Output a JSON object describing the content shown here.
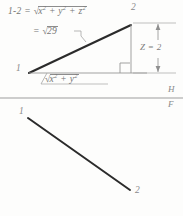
{
  "drawing": {
    "title": "true-length-line-construction",
    "ink_color": "#2b2b2b",
    "pencil_color": "#7d7d7d",
    "background": "#fdfdfc"
  },
  "top_view": {
    "equation_line_1": {
      "lhs": "1-2 =",
      "radical": "√",
      "radicand": "x² + y² + z²"
    },
    "equation_line_2": {
      "lhs": "=",
      "radical": "√",
      "radicand": "29"
    },
    "point_1_label": "1",
    "point_2_label": "2",
    "base_label": {
      "radical": "√",
      "radicand": "x² + y²"
    },
    "vertical_dimension_label": "Z = 2",
    "right_angle_marker": "right-angle-square"
  },
  "reference_line": {
    "above_label": "H",
    "below_label": "F"
  },
  "front_view": {
    "point_1_label": "1",
    "point_2_label": "2"
  }
}
